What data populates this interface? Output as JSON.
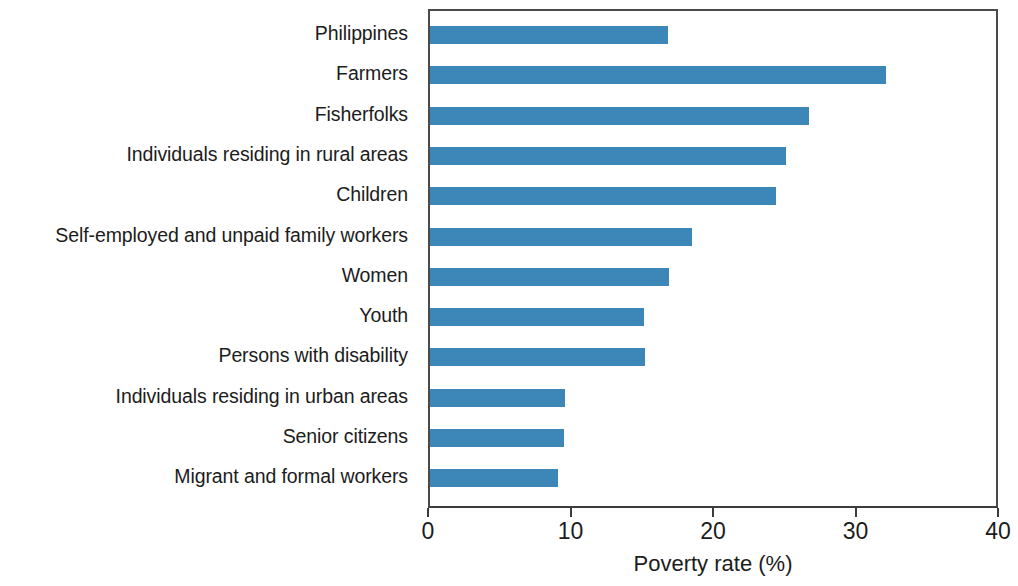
{
  "chart_data": {
    "type": "bar",
    "orientation": "horizontal",
    "title": "",
    "subtitle": "",
    "xlabel": "Poverty rate (%)",
    "ylabel": "",
    "xlim": [
      0,
      40
    ],
    "xticks": [
      0,
      10,
      20,
      30,
      40
    ],
    "xtick_labels": [
      "0",
      "10",
      "20",
      "30",
      "40"
    ],
    "grid": false,
    "legend": null,
    "legend_position": "none",
    "bar_color": "#3d87b8",
    "axis_color": "#3c3c3c",
    "categories": [
      "Philippines",
      "Farmers",
      "Fisherfolks",
      "Individuals residing in rural areas",
      "Children",
      "Self-employed and unpaid family workers",
      "Women",
      "Youth",
      "Persons with disability",
      "Individuals residing in urban areas",
      "Senior citizens",
      "Migrant and formal workers"
    ],
    "values": [
      16.7,
      32.0,
      26.6,
      25.0,
      24.3,
      18.4,
      16.8,
      15.0,
      15.1,
      9.5,
      9.4,
      9.0
    ],
    "series": [
      {
        "name": "Poverty rate (%)",
        "values": [
          16.7,
          32.0,
          26.6,
          25.0,
          24.3,
          18.4,
          16.8,
          15.0,
          15.1,
          9.5,
          9.4,
          9.0
        ]
      }
    ]
  }
}
